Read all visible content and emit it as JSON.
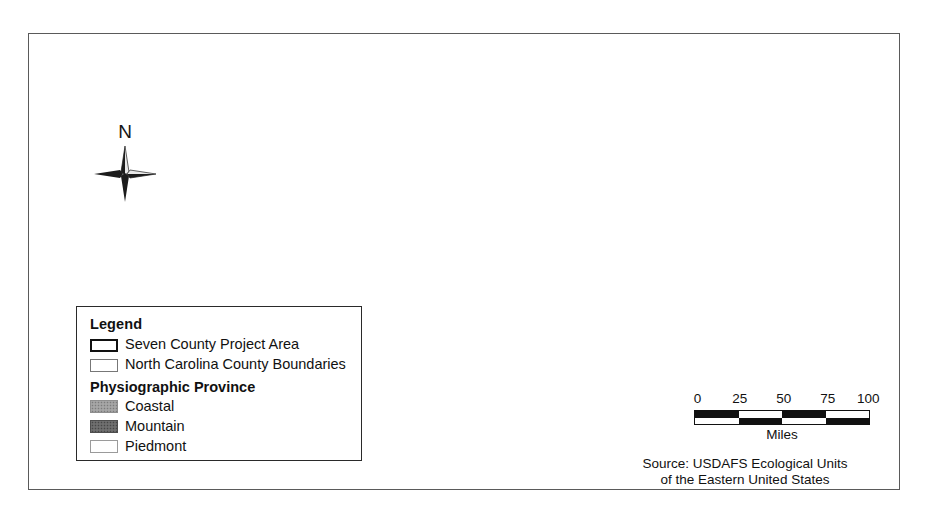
{
  "figure": {
    "kind": "thematic-map",
    "region": "North Carolina",
    "frame_color": "#5a5a5a",
    "background": "#ffffff"
  },
  "north_arrow": {
    "label": "N",
    "icon": "compass-rose-icon"
  },
  "legend": {
    "title": "Legend",
    "entries": [
      {
        "swatch": "project-area",
        "label": "Seven County Project Area"
      },
      {
        "swatch": "county-boundaries",
        "label": "North Carolina County Boundaries"
      }
    ],
    "subtitle": "Physiographic Province",
    "provinces": [
      {
        "swatch": "coastal",
        "label": "Coastal",
        "color": "#9d9d9d"
      },
      {
        "swatch": "mountain",
        "label": "Mountain",
        "color": "#666666"
      },
      {
        "swatch": "piedmont",
        "label": "Piedmont",
        "color": "#fefefe"
      }
    ]
  },
  "scale_bar": {
    "ticks": [
      "0",
      "25",
      "50",
      "75",
      "100"
    ],
    "units": "Miles",
    "max_value": 100,
    "segments": 4
  },
  "source": {
    "line1": "Source: USDAFS Ecological Units",
    "line2": "of the Eastern United States"
  },
  "map_layers": {
    "mountain_label": "Mountain province",
    "coastal_label": "Coastal province",
    "piedmont_label": "Piedmont province",
    "project_area_label": "Seven County Project Area",
    "water_label": "Sounds and estuaries",
    "county_lines_label": "County boundaries"
  }
}
